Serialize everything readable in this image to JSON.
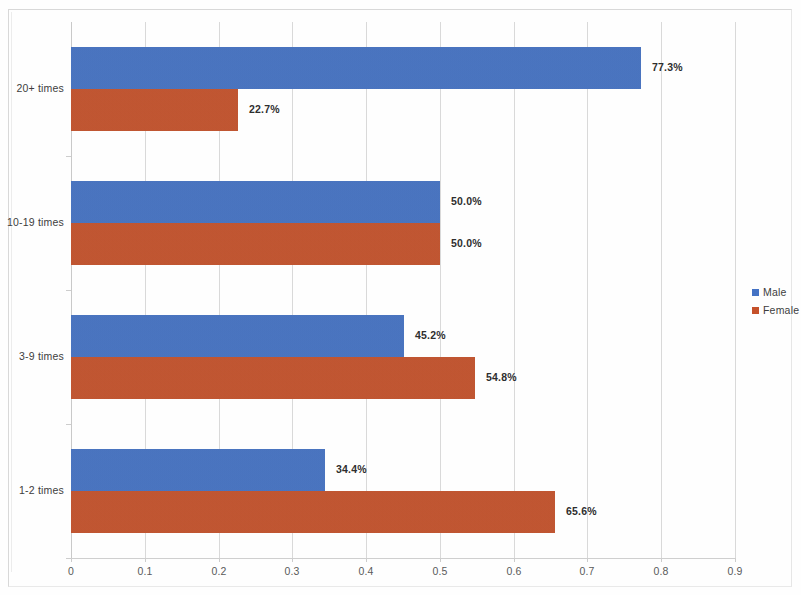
{
  "chart_data": {
    "type": "bar",
    "orientation": "horizontal",
    "title": "",
    "xlabel": "",
    "ylabel": "",
    "categories": [
      "20+ times",
      "10-19 times",
      "3-9 times",
      "1-2 times"
    ],
    "series": [
      {
        "name": "Male",
        "color": "#4472c4",
        "values": [
          0.773,
          0.5,
          0.452,
          0.344
        ],
        "labels": [
          "77.3%",
          "50.0%",
          "45.2%",
          "34.4%"
        ]
      },
      {
        "name": "Female",
        "color": "#c5512a",
        "values": [
          0.227,
          0.5,
          0.548,
          0.656
        ],
        "labels": [
          "22.7%",
          "50.0%",
          "54.8%",
          "65.6%"
        ]
      }
    ],
    "xlim": [
      0,
      0.9
    ],
    "xticks": [
      0,
      0.1,
      0.2,
      0.3,
      0.4,
      0.5,
      0.6,
      0.7,
      0.8,
      0.9
    ],
    "xticklabels": [
      "0",
      "0.1",
      "0.2",
      "0.3",
      "0.4",
      "0.5",
      "0.6",
      "0.7",
      "0.8",
      "0.9"
    ],
    "grid": true,
    "grid_axis": "x",
    "legend_position": "right",
    "data_labels": true
  },
  "legend": {
    "items": [
      {
        "label": "Male",
        "color": "#4472c4"
      },
      {
        "label": "Female",
        "color": "#c5512a"
      }
    ]
  },
  "colors": {
    "male": "#4472c4",
    "female": "#c5512a",
    "gridline": "#d9d9d9",
    "text": "#3d3d3d"
  }
}
